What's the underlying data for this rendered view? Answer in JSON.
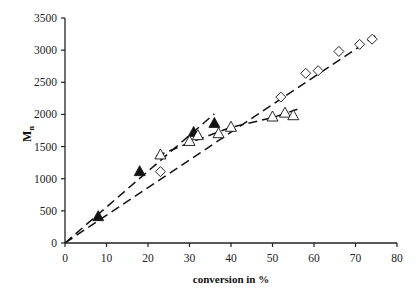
{
  "chart_data": {
    "type": "scatter",
    "title": "",
    "xlabel": "conversion in %",
    "ylabel": "Mn",
    "ylabel_main": "M",
    "ylabel_sub": "n",
    "xlim": [
      0,
      80
    ],
    "ylim": [
      0,
      3500
    ],
    "x_ticks": [
      0,
      10,
      20,
      30,
      40,
      50,
      60,
      70,
      80
    ],
    "y_ticks": [
      0,
      500,
      1000,
      1500,
      2000,
      2500,
      3000,
      3500
    ],
    "grid": false,
    "legend": null,
    "series": [
      {
        "name": "filled triangles",
        "marker": "triangle-filled",
        "points": [
          [
            8,
            410
          ],
          [
            18,
            1110
          ],
          [
            31,
            1720
          ],
          [
            36,
            1860
          ]
        ],
        "trendline": [
          [
            0,
            0
          ],
          [
            36,
            2010
          ]
        ]
      },
      {
        "name": "open triangles",
        "marker": "triangle-open",
        "points": [
          [
            23,
            1370
          ],
          [
            30,
            1580
          ],
          [
            32,
            1670
          ],
          [
            37,
            1700
          ],
          [
            40,
            1800
          ],
          [
            50,
            1960
          ],
          [
            53,
            2020
          ],
          [
            55,
            1980
          ]
        ],
        "trendline": [
          [
            22,
            1350
          ],
          [
            30,
            1560
          ],
          [
            40,
            1800
          ],
          [
            50,
            1950
          ],
          [
            56,
            2080
          ]
        ]
      },
      {
        "name": "open diamonds",
        "marker": "diamond-open",
        "points": [
          [
            23,
            1110
          ],
          [
            52,
            2270
          ],
          [
            58,
            2640
          ],
          [
            61,
            2680
          ],
          [
            66,
            2980
          ],
          [
            71,
            3090
          ],
          [
            74,
            3170
          ]
        ],
        "trendline": [
          [
            0,
            0
          ],
          [
            75,
            3230
          ]
        ]
      }
    ],
    "colors": {
      "axis": "#222222",
      "marker": "#111111",
      "line": "#111111",
      "background": "#ffffff"
    }
  }
}
